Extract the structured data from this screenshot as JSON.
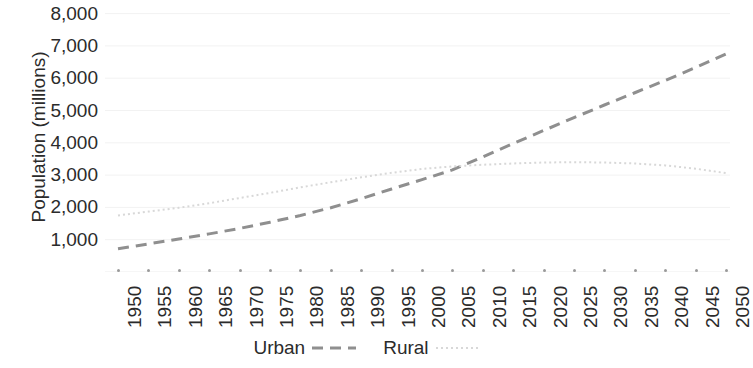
{
  "chart_data": {
    "type": "line",
    "title": "",
    "xlabel": "",
    "ylabel": "Population (millions)",
    "xlim": [
      1950,
      2050
    ],
    "ylim": [
      0,
      8000
    ],
    "grid": true,
    "grid_axis": "y",
    "legend_position": "bottom",
    "x": [
      1950,
      1955,
      1960,
      1965,
      1970,
      1975,
      1980,
      1985,
      1990,
      1995,
      2000,
      2005,
      2010,
      2015,
      2020,
      2025,
      2030,
      2035,
      2040,
      2045,
      2050
    ],
    "y_ticks": [
      1000,
      2000,
      3000,
      4000,
      5000,
      6000,
      7000,
      8000
    ],
    "y_tick_labels": [
      "1,000",
      "2,000",
      "3,000",
      "4,000",
      "5,000",
      "6,000",
      "7,000",
      "8,000"
    ],
    "x_tick_labels": [
      "1950",
      "1955",
      "1960",
      "1965",
      "1970",
      "1975",
      "1980",
      "1985",
      "1990",
      "1995",
      "2000",
      "2005",
      "2010",
      "2015",
      "2020",
      "2025",
      "2030",
      "2035",
      "2040",
      "2045",
      "2050"
    ],
    "series": [
      {
        "name": "Urban",
        "style": "dashed",
        "color": "#8f8f8f",
        "values": [
          720,
          870,
          1020,
          1180,
          1350,
          1540,
          1750,
          1990,
          2270,
          2570,
          2860,
          3160,
          3560,
          3980,
          4380,
          4780,
          5170,
          5550,
          5930,
          6330,
          6750
        ]
      },
      {
        "name": "Rural",
        "style": "dotted",
        "color": "#d8d8d8",
        "values": [
          1750,
          1870,
          1990,
          2130,
          2290,
          2450,
          2620,
          2780,
          2930,
          3070,
          3190,
          3270,
          3320,
          3360,
          3390,
          3400,
          3390,
          3360,
          3300,
          3200,
          3060
        ]
      }
    ],
    "annotations": []
  },
  "axis": {
    "y_title": "Population (millions)"
  },
  "legend": {
    "items": [
      {
        "label": "Urban",
        "style": "dashed",
        "color": "#8f8f8f"
      },
      {
        "label": "Rural",
        "style": "dotted",
        "color": "#d8d8d8"
      }
    ]
  },
  "colors": {
    "background": "#ffffff",
    "text": "#2b2b2b",
    "grid": "#f2f2f2",
    "tick": "#9a9a9a",
    "urban": "#8f8f8f",
    "rural": "#d8d8d8"
  }
}
